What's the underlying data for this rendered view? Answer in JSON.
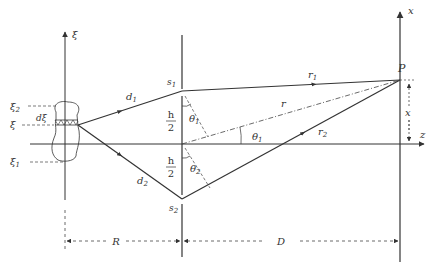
{
  "diagram": {
    "type": "double-slit interference with extended source",
    "colors": {
      "line": "#333333",
      "dashed": "#444444",
      "background": "#ffffff"
    },
    "axes": {
      "source_axis": {
        "label": "ξ"
      },
      "observation_axis": {
        "label": "x"
      },
      "optical_axis": {
        "label": "z"
      }
    },
    "source": {
      "levels": [
        {
          "label": "ξ",
          "sub": "2"
        },
        {
          "label": "ξ",
          "sub": ""
        },
        {
          "label": "ξ",
          "sub": "1"
        }
      ],
      "element_label": "dξ"
    },
    "slits": {
      "upper": {
        "label": "s",
        "sub": "1"
      },
      "lower": {
        "label": "s",
        "sub": "2"
      },
      "half_separation": {
        "numerator": "h",
        "denominator": "2"
      }
    },
    "paths": {
      "d1": {
        "label": "d",
        "sub": "1"
      },
      "d2": {
        "label": "d",
        "sub": "2"
      },
      "r1": {
        "label": "r",
        "sub": "1"
      },
      "r2": {
        "label": "r",
        "sub": "2"
      },
      "r": {
        "label": "r"
      }
    },
    "angles": {
      "theta1": {
        "label": "θ",
        "sub": "1"
      },
      "theta2": {
        "label": "θ",
        "sub": "2"
      }
    },
    "point": {
      "label": "P",
      "offset_label": "x"
    },
    "dimensions": {
      "R": {
        "label": "R"
      },
      "D": {
        "label": "D"
      }
    }
  }
}
